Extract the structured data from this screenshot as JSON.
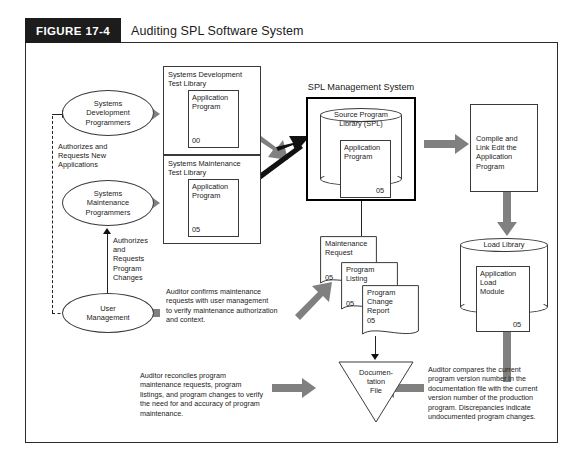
{
  "figure": {
    "tag": "FIGURE 17-4",
    "title": "Auditing SPL Software System"
  },
  "colors": {
    "gray_arrow": "#808080",
    "black_arrow": "#111111",
    "outline": "#3a3a3a",
    "tag_background": "#1c1c1c",
    "page_background": "#ffffff"
  },
  "entities": {
    "systems_development_programmers": "Systems\nDevelopment\nProgrammers",
    "systems_maintenance_programmers": "Systems\nMaintenance\nProgrammers",
    "user_management": "User\nManagement"
  },
  "labels": {
    "authorizes_new_applications": "Authorizes and\nRequests New\nApplications",
    "authorizes_program_changes": "Authorizes\nand\nRequests\nProgram\nChanges",
    "systems_development_test_library": "Systems Development\nTest Library",
    "systems_maintenance_test_library": "Systems Maintenance\nTest Library",
    "spl_management_system": "SPL Management System",
    "source_program_library": "Source Program\nLibrary (SPL)",
    "load_library": "Load Library"
  },
  "program_boxes": {
    "dev_application_program": {
      "label": "Application\nProgram",
      "version": "00"
    },
    "maint_application_program": {
      "label": "Application\nProgram",
      "version": "05"
    },
    "spl_application_program": {
      "label": "Application\nProgram",
      "version": "05"
    },
    "application_load_module": {
      "label": "Application\nLoad\nModule",
      "version": "05"
    }
  },
  "process_boxes": {
    "compile_and_link": "Compile and\nLink Edit the\nApplication\nProgram"
  },
  "documents": [
    {
      "name": "maintenance-request",
      "label": "Maintenance\nRequest",
      "version": "05"
    },
    {
      "name": "program-listing",
      "label": "Program\nListing",
      "version": "05"
    },
    {
      "name": "program-change-report",
      "label": "Program\nChange\nReport",
      "version": "05"
    }
  ],
  "documentation_file": "Documen-\ntation\nFile",
  "audit_notes": {
    "confirm_maintenance": "Auditor confirms maintenance\nrequests with user management\nto verify maintenance authorization\nand context.",
    "reconcile_program": "Auditor reconciles program\nmaintenance requests, program\nlistings, and program changes to verify\nthe need for and accuracy of program\nmaintenance.",
    "compare_versions": "Auditor compares the current\nprogram version number in the\ndocumentation file with the current\nversion number of the production\nprogram.  Discrepancies indicate\nundocumented program changes."
  }
}
